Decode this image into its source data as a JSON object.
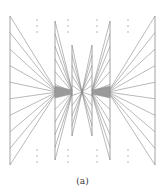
{
  "caption": "(a)",
  "colors": {
    "line": "#8a8a8a",
    "fill": "#9a9a9a",
    "dots": "#9a9a9a"
  },
  "geometry": {
    "center": [
      82,
      92
    ],
    "columns_left": [
      {
        "x": 10,
        "y1": 16,
        "y2": 165
      },
      {
        "x": 55,
        "y1": 21,
        "y2": 160
      },
      {
        "x": 72,
        "y1": 45,
        "y2": 136
      }
    ],
    "columns_right": [
      {
        "x": 92,
        "y1": 45,
        "y2": 136
      },
      {
        "x": 110,
        "y1": 21,
        "y2": 160
      },
      {
        "x": 155,
        "y1": 16,
        "y2": 165
      }
    ],
    "outer_rays": 10,
    "mid_rays": 12,
    "inner_rays": 10,
    "dot_columns_x": [
      37,
      68,
      97,
      128
    ],
    "dots_top_y": [
      20,
      26,
      32
    ],
    "dots_bottom_y": [
      150,
      156,
      162
    ]
  }
}
